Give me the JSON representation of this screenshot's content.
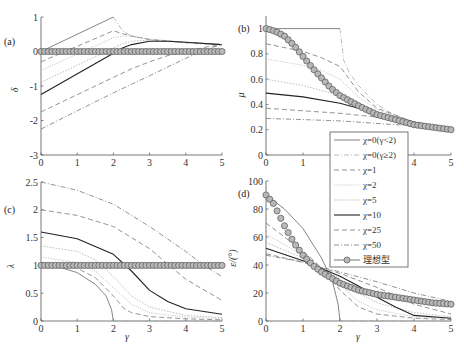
{
  "chart_data": [
    {
      "type": "line",
      "panel_label": "(a)",
      "xlabel": "",
      "ylabel": "δ",
      "xlim": [
        0,
        5
      ],
      "ylim": [
        -3,
        1
      ],
      "xticks": [
        0,
        1,
        2,
        3,
        4,
        5
      ],
      "yticks": [
        -3,
        -2,
        -1,
        0,
        1
      ],
      "series": [
        {
          "name": "χ=0(γ<2)",
          "x": [
            0,
            2
          ],
          "y": [
            0,
            1
          ]
        },
        {
          "name": "χ=0(γ≥2)",
          "x": [
            2,
            2.25,
            2.5,
            3,
            3.5,
            4,
            4.5,
            5
          ],
          "y": [
            1,
            0.6,
            0.45,
            0.34,
            0.29,
            0.25,
            0.22,
            0.2
          ]
        },
        {
          "name": "χ=1",
          "x": [
            0,
            2,
            2.25,
            2.5,
            3,
            4,
            5
          ],
          "y": [
            -0.3,
            0.6,
            0.52,
            0.45,
            0.35,
            0.26,
            0.2
          ]
        },
        {
          "name": "χ=2",
          "x": [
            0,
            2,
            2.25,
            2.5,
            3,
            4,
            5
          ],
          "y": [
            -0.55,
            0.4,
            0.45,
            0.44,
            0.36,
            0.27,
            0.2
          ]
        },
        {
          "name": "χ=5",
          "x": [
            0,
            2,
            2.25,
            2.5,
            3,
            4,
            5
          ],
          "y": [
            -0.9,
            0.1,
            0.22,
            0.3,
            0.33,
            0.27,
            0.2
          ]
        },
        {
          "name": "χ=10",
          "x": [
            0,
            2,
            2.25,
            2.5,
            3,
            3.5,
            4,
            5
          ],
          "y": [
            -1.25,
            -0.05,
            0.1,
            0.2,
            0.3,
            0.3,
            0.27,
            0.2
          ]
        },
        {
          "name": "χ=25",
          "x": [
            0,
            2,
            2.5,
            3,
            3.5,
            4,
            4.3,
            4.6,
            5
          ],
          "y": [
            -1.75,
            -0.75,
            -0.5,
            -0.3,
            -0.12,
            0.0,
            0.06,
            0.14,
            0.2
          ]
        },
        {
          "name": "χ=50",
          "x": [
            0,
            1,
            2,
            2.5,
            3,
            3.5,
            4,
            4.5,
            5
          ],
          "y": [
            -2.25,
            -1.72,
            -1.2,
            -0.95,
            -0.7,
            -0.45,
            -0.2,
            0.05,
            0.2
          ]
        },
        {
          "name": "理想型",
          "x": [
            0,
            5
          ],
          "y": [
            0,
            0
          ]
        }
      ]
    },
    {
      "type": "line",
      "panel_label": "(b)",
      "xlabel": "",
      "ylabel": "μ",
      "xlim": [
        0,
        5
      ],
      "ylim": [
        0,
        1.1
      ],
      "xticks": [
        0,
        1,
        2,
        3,
        4,
        5
      ],
      "yticks": [
        0,
        0.2,
        0.4,
        0.6,
        0.8,
        1
      ],
      "series": [
        {
          "name": "χ=0(γ<2)",
          "x": [
            0,
            2
          ],
          "y": [
            1,
            1
          ]
        },
        {
          "name": "χ=0(γ≥2)",
          "x": [
            2,
            2.1,
            2.25,
            2.5,
            3,
            3.5,
            4,
            4.5,
            5
          ],
          "y": [
            1,
            0.75,
            0.65,
            0.55,
            0.4,
            0.31,
            0.26,
            0.22,
            0.2
          ]
        },
        {
          "name": "χ=1",
          "x": [
            0,
            1,
            1.5,
            2,
            2.25,
            2.5,
            3,
            4,
            5
          ],
          "y": [
            0.88,
            0.82,
            0.77,
            0.7,
            0.6,
            0.5,
            0.37,
            0.26,
            0.2
          ]
        },
        {
          "name": "χ=2",
          "x": [
            0,
            1,
            1.5,
            2,
            2.5,
            3,
            4,
            5
          ],
          "y": [
            0.76,
            0.71,
            0.67,
            0.6,
            0.46,
            0.36,
            0.26,
            0.2
          ]
        },
        {
          "name": "χ=5",
          "x": [
            0,
            1,
            2,
            2.5,
            3,
            4,
            5
          ],
          "y": [
            0.6,
            0.55,
            0.47,
            0.4,
            0.34,
            0.26,
            0.2
          ]
        },
        {
          "name": "χ=10",
          "x": [
            0,
            1,
            2,
            3,
            4,
            5
          ],
          "y": [
            0.49,
            0.46,
            0.41,
            0.33,
            0.26,
            0.2
          ]
        },
        {
          "name": "χ=25",
          "x": [
            0,
            1,
            2,
            3,
            4,
            5
          ],
          "y": [
            0.37,
            0.35,
            0.33,
            0.3,
            0.25,
            0.2
          ]
        },
        {
          "name": "χ=50",
          "x": [
            0,
            1,
            2,
            3,
            4,
            5
          ],
          "y": [
            0.29,
            0.28,
            0.27,
            0.25,
            0.23,
            0.2
          ]
        },
        {
          "name": "理想型",
          "x": [
            0,
            0.25,
            0.5,
            0.75,
            1,
            1.25,
            1.5,
            1.75,
            2,
            2.5,
            3,
            3.5,
            4,
            4.5,
            5
          ],
          "y": [
            1,
            0.98,
            0.94,
            0.87,
            0.78,
            0.69,
            0.61,
            0.53,
            0.47,
            0.39,
            0.32,
            0.28,
            0.24,
            0.22,
            0.2
          ]
        }
      ]
    },
    {
      "type": "line",
      "panel_label": "(c)",
      "xlabel": "γ",
      "ylabel": "λ",
      "xlim": [
        0,
        5
      ],
      "ylim": [
        0,
        2.5
      ],
      "xticks": [
        0,
        1,
        2,
        3,
        4,
        5
      ],
      "yticks": [
        0,
        0.5,
        1,
        1.5,
        2,
        2.5
      ],
      "series": [
        {
          "name": "χ=0(γ<2)",
          "x": [
            0,
            0.5,
            1,
            1.5,
            1.8,
            1.95,
            2
          ],
          "y": [
            1,
            0.97,
            0.87,
            0.66,
            0.45,
            0.2,
            0
          ]
        },
        {
          "name": "χ=0(γ≥2)",
          "x": [
            2,
            5
          ],
          "y": [
            0,
            0
          ]
        },
        {
          "name": "χ=1",
          "x": [
            0,
            1,
            1.5,
            2,
            2.3,
            2.5,
            3,
            4,
            5
          ],
          "y": [
            1.05,
            0.95,
            0.78,
            0.45,
            0.22,
            0.15,
            0.08,
            0.04,
            0.02
          ]
        },
        {
          "name": "χ=2",
          "x": [
            0,
            1,
            1.5,
            2,
            2.5,
            3,
            4,
            5
          ],
          "y": [
            1.15,
            1.05,
            0.9,
            0.6,
            0.3,
            0.15,
            0.07,
            0.04
          ]
        },
        {
          "name": "χ=5",
          "x": [
            0,
            1,
            1.5,
            2,
            2.5,
            3,
            4,
            5
          ],
          "y": [
            1.35,
            1.25,
            1.1,
            0.8,
            0.45,
            0.25,
            0.1,
            0.06
          ]
        },
        {
          "name": "χ=10",
          "x": [
            0,
            1,
            2,
            2.5,
            3,
            3.5,
            4,
            5
          ],
          "y": [
            1.6,
            1.48,
            1.2,
            0.9,
            0.55,
            0.35,
            0.22,
            0.12
          ]
        },
        {
          "name": "χ=25",
          "x": [
            0,
            1,
            2,
            3,
            4,
            5
          ],
          "y": [
            2.0,
            1.9,
            1.7,
            1.3,
            0.75,
            0.37
          ]
        },
        {
          "name": "χ=50",
          "x": [
            0,
            1,
            2,
            3,
            4,
            4.5,
            5
          ],
          "y": [
            2.5,
            2.35,
            2.1,
            1.7,
            1.25,
            1.0,
            0.8
          ]
        },
        {
          "name": "理想型",
          "x": [
            0,
            5
          ],
          "y": [
            1,
            1
          ]
        }
      ]
    },
    {
      "type": "line",
      "panel_label": "(d)",
      "xlabel": "γ",
      "ylabel": "ε/(°)",
      "xlim": [
        0,
        5
      ],
      "ylim": [
        0,
        100
      ],
      "xticks": [
        0,
        1,
        2,
        3,
        4,
        5
      ],
      "yticks": [
        0,
        20,
        40,
        60,
        80,
        100
      ],
      "series": [
        {
          "name": "χ=0(γ<2)",
          "x": [
            0,
            0.5,
            1,
            1.5,
            1.8,
            1.95,
            2
          ],
          "y": [
            90,
            80,
            66,
            45,
            28,
            12,
            0
          ]
        },
        {
          "name": "χ=0(γ≥2)",
          "x": [
            2,
            5
          ],
          "y": [
            0,
            0
          ]
        },
        {
          "name": "χ=1",
          "x": [
            0,
            1,
            1.5,
            2,
            2.5,
            3,
            4,
            5
          ],
          "y": [
            70,
            50,
            38,
            22,
            10,
            5,
            2,
            1
          ]
        },
        {
          "name": "χ=2",
          "x": [
            0,
            1,
            1.5,
            2,
            2.5,
            3,
            4,
            5
          ],
          "y": [
            62,
            47,
            38,
            26,
            14,
            8,
            3,
            2
          ]
        },
        {
          "name": "χ=5",
          "x": [
            0,
            1,
            2,
            2.5,
            3,
            4,
            5
          ],
          "y": [
            56,
            45,
            30,
            20,
            13,
            6,
            3
          ]
        },
        {
          "name": "χ=10",
          "x": [
            0,
            1,
            2,
            2.5,
            3,
            3.5,
            4,
            5
          ],
          "y": [
            52,
            43,
            32,
            25,
            17,
            10,
            4,
            2
          ]
        },
        {
          "name": "χ=25",
          "x": [
            0,
            1,
            2,
            3,
            4,
            5
          ],
          "y": [
            48,
            42,
            34,
            24,
            12,
            5
          ]
        },
        {
          "name": "χ=50",
          "x": [
            0,
            1,
            2,
            3,
            4,
            5
          ],
          "y": [
            47,
            42,
            35,
            28,
            20,
            14
          ]
        },
        {
          "name": "理想型",
          "x": [
            0,
            0.2,
            0.5,
            0.75,
            1,
            1.25,
            1.5,
            2,
            2.5,
            3,
            3.5,
            4,
            4.5,
            5
          ],
          "y": [
            90,
            84,
            68,
            56,
            47,
            40,
            35,
            27,
            22,
            19,
            17,
            15,
            13,
            12
          ]
        }
      ]
    }
  ],
  "legend": {
    "entries": [
      {
        "label": "χ=0(γ<2)",
        "style": "solid",
        "color": "#666666",
        "width": 0.8
      },
      {
        "label": "χ=0(γ≥2)",
        "style": "dashdot-light",
        "color": "#aaaaaa",
        "width": 0.8
      },
      {
        "label": "χ=1",
        "style": "dashed",
        "color": "#777777",
        "width": 0.8
      },
      {
        "label": "χ=2",
        "style": "dotted-light",
        "color": "#bbbbbb",
        "width": 0.8
      },
      {
        "label": "χ=5",
        "style": "dotted",
        "color": "#aaaaaa",
        "width": 0.8
      },
      {
        "label": "χ=10",
        "style": "solid-dark",
        "color": "#222222",
        "width": 1.1
      },
      {
        "label": "χ=25",
        "style": "dashed",
        "color": "#777777",
        "width": 0.8
      },
      {
        "label": "χ=50",
        "style": "dashdot",
        "color": "#777777",
        "width": 0.8
      },
      {
        "label": "理想型",
        "style": "marker-circle",
        "color": "#555555",
        "fill": "#b8b8b8"
      }
    ]
  },
  "colors": {
    "axis": "#555555",
    "marker_fill": "#b8b8b8",
    "marker_stroke": "#555555"
  }
}
